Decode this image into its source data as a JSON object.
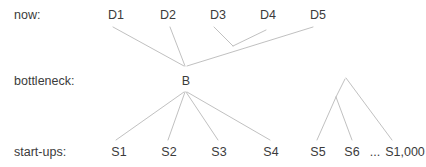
{
  "diagram": {
    "type": "tree-diagram",
    "line_color": "#b9b9b9",
    "text_color": "#3b3b3b",
    "background_color": "#ffffff",
    "rows": [
      {
        "id": "now",
        "label": "now:",
        "x": 14,
        "y": 8
      },
      {
        "id": "bottleneck",
        "label": "bottleneck:",
        "x": 14,
        "y": 74
      },
      {
        "id": "startups",
        "label": "start-ups:",
        "x": 14,
        "y": 145
      }
    ],
    "nodes": [
      {
        "id": "d1",
        "label": "D1",
        "row": "now",
        "x": 116,
        "y": 8
      },
      {
        "id": "d2",
        "label": "D2",
        "row": "now",
        "x": 168,
        "y": 8
      },
      {
        "id": "d3",
        "label": "D3",
        "row": "now",
        "x": 218,
        "y": 8
      },
      {
        "id": "d4",
        "label": "D4",
        "row": "now",
        "x": 268,
        "y": 8
      },
      {
        "id": "d5",
        "label": "D5",
        "row": "now",
        "x": 318,
        "y": 8
      },
      {
        "id": "b",
        "label": "B",
        "row": "bottleneck",
        "x": 186,
        "y": 74
      },
      {
        "id": "s1",
        "label": "S1",
        "row": "startups",
        "x": 119,
        "y": 145
      },
      {
        "id": "s2",
        "label": "S2",
        "row": "startups",
        "x": 169,
        "y": 145
      },
      {
        "id": "s3",
        "label": "S3",
        "row": "startups",
        "x": 219,
        "y": 145
      },
      {
        "id": "s4",
        "label": "S4",
        "row": "startups",
        "x": 271,
        "y": 145
      },
      {
        "id": "s5",
        "label": "S5",
        "row": "startups",
        "x": 318,
        "y": 145
      },
      {
        "id": "s6",
        "label": "S6",
        "row": "startups",
        "x": 352,
        "y": 145
      },
      {
        "id": "ellipsis",
        "label": "...",
        "row": "startups",
        "x": 375,
        "y": 145
      },
      {
        "id": "s1000",
        "label": "S1,000",
        "row": "startups",
        "x": 405,
        "y": 145
      }
    ],
    "edges": [
      {
        "from": "d1",
        "to": "b",
        "x1": 113,
        "y1": 27,
        "x2": 184,
        "y2": 66
      },
      {
        "from": "d2",
        "to": "b",
        "x1": 170,
        "y1": 27,
        "x2": 185,
        "y2": 66
      },
      {
        "from": "d5",
        "to": "b",
        "x1": 313,
        "y1": 27,
        "x2": 187,
        "y2": 66
      },
      {
        "from": "d3",
        "to": "trunk",
        "x1": 214,
        "y1": 27,
        "x2": 233,
        "y2": 46
      },
      {
        "from": "d4",
        "to": "trunk",
        "x1": 266,
        "y1": 30,
        "x2": 233,
        "y2": 46
      },
      {
        "from": "b",
        "to": "s1",
        "x1": 184,
        "y1": 92,
        "x2": 116,
        "y2": 140
      },
      {
        "from": "b",
        "to": "s2",
        "x1": 185,
        "y1": 92,
        "x2": 168,
        "y2": 140
      },
      {
        "from": "b",
        "to": "s3",
        "x1": 186,
        "y1": 92,
        "x2": 218,
        "y2": 140
      },
      {
        "from": "b",
        "to": "s4",
        "x1": 187,
        "y1": 92,
        "x2": 270,
        "y2": 140
      },
      {
        "from": "cluster-apex",
        "to": "s1000",
        "x1": 346,
        "y1": 78,
        "x2": 392,
        "y2": 140
      },
      {
        "from": "cluster-apex",
        "to": "subnode",
        "x1": 345,
        "y1": 79,
        "x2": 336,
        "y2": 97
      },
      {
        "from": "subnode",
        "to": "s5",
        "x1": 336,
        "y1": 97,
        "x2": 317,
        "y2": 140
      },
      {
        "from": "subnode",
        "to": "s6",
        "x1": 336,
        "y1": 97,
        "x2": 352,
        "y2": 140
      }
    ]
  }
}
